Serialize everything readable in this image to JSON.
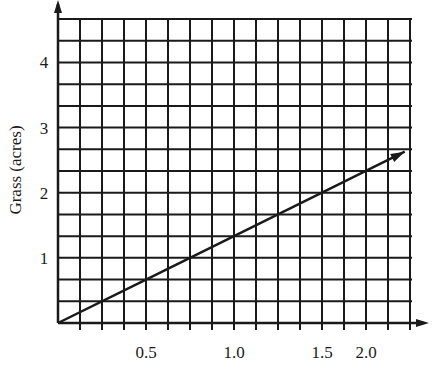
{
  "chart_data": {
    "type": "line",
    "title": "",
    "xlabel": "",
    "ylabel": "Grass (acres)",
    "xlim": [
      0,
      2.0
    ],
    "ylim": [
      0,
      4.667
    ],
    "grid": true,
    "grid_x_step": 0.125,
    "grid_y_step": 0.3333,
    "x_tick_labels": [
      {
        "label": "0.5",
        "value": 0.5
      },
      {
        "label": "1.0",
        "value": 1.0
      },
      {
        "label": "1.5",
        "value": 1.5
      },
      {
        "label": "2.0",
        "value": 1.75
      }
    ],
    "y_tick_labels": [
      {
        "label": "1",
        "value": 1
      },
      {
        "label": "2",
        "value": 2
      },
      {
        "label": "3",
        "value": 3
      },
      {
        "label": "4",
        "value": 4
      }
    ],
    "series": [
      {
        "name": "grass",
        "x": [
          0,
          0.5,
          1.0,
          1.5,
          1.97
        ],
        "y": [
          0,
          0.667,
          1.333,
          2.0,
          2.63
        ],
        "slope": 1.333,
        "arrow_end": true
      }
    ],
    "legend": null
  },
  "colors": {
    "ink": "#1a1a1a",
    "background": "#ffffff"
  }
}
